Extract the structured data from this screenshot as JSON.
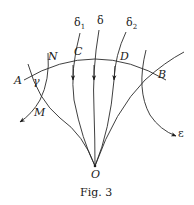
{
  "figure": {
    "caption": "Fig. 3",
    "labels": {
      "A": "A",
      "B": "B",
      "C": "C",
      "D": "D",
      "N": "N",
      "M": "M",
      "O": "O",
      "gamma": "γ",
      "epsilon": "ε",
      "delta": "δ",
      "delta1_base": "δ",
      "delta1_sub": "1",
      "delta2_base": "δ",
      "delta2_sub": "2"
    },
    "colors": {
      "ink": "#1a1a1a",
      "background": "#ffffff"
    }
  }
}
